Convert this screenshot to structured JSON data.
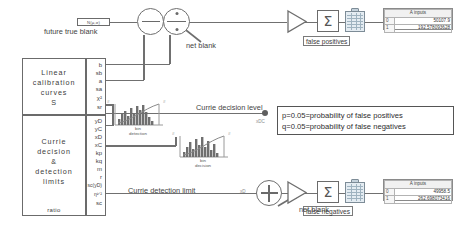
{
  "diagram": {
    "future_true_blank": {
      "value_box": "N(μ,σ)",
      "caption": "future true blank"
    },
    "calibration_box": {
      "title_lines": [
        "Linear",
        "calibration",
        "curves",
        "S"
      ],
      "outputs": [
        "b",
        "sb",
        "a",
        "sa",
        "χ²",
        "sr"
      ]
    },
    "currie_box": {
      "title_lines": [
        "Currie",
        "decision",
        "&",
        "detection",
        "limits"
      ],
      "outputs": [
        "yD",
        "yC",
        "xD",
        "xC",
        "kp",
        "kq",
        "m",
        "r",
        "sc(yD)",
        "η¹ᐟ²",
        "sc"
      ],
      "footer": "ratio"
    },
    "histograms": [
      {
        "caption_line1": "bin",
        "caption_line2": "detection",
        "left_marker": "#",
        "right_marker": "#"
      },
      {
        "caption_line1": "bin",
        "caption_line2": "decision",
        "left_marker": "#",
        "right_marker": "#"
      }
    ],
    "signal_labels": {
      "net_blank_top": "net blank",
      "net_blank_bottom": "net blank",
      "currie_decision_level": "Currie decision level",
      "currie_detection_limit": "Currie detection limit",
      "xdc_marker": "xDC",
      "xd_marker": "xD"
    },
    "operators": {
      "subtract": "−",
      "divide": "÷",
      "add": "+",
      "sum_top": "Σ",
      "sum_bottom": "Σ"
    },
    "tags": {
      "false_positives": "false positives",
      "false_negatives": "false negatives"
    },
    "probability_box": {
      "line1": "p=0.05=probability of false positives",
      "line2": "q=0.05=probability of false negatives"
    },
    "tables": [
      {
        "name": "false-positives-table",
        "header": "A inputs",
        "rows": [
          {
            "index": "0",
            "value": "50107.9"
          },
          {
            "index": "1",
            "value": "192.578093628"
          }
        ]
      },
      {
        "name": "false-negatives-table",
        "header": "A inputs",
        "rows": [
          {
            "index": "0",
            "value": "49958.5"
          },
          {
            "index": "1",
            "value": "262.698073416"
          }
        ]
      }
    ],
    "colors": {
      "wire": "#707070",
      "box_border": "#6b6b6b",
      "sheet_fill": "#e4ecf2",
      "text": "#3a3a3a"
    }
  }
}
